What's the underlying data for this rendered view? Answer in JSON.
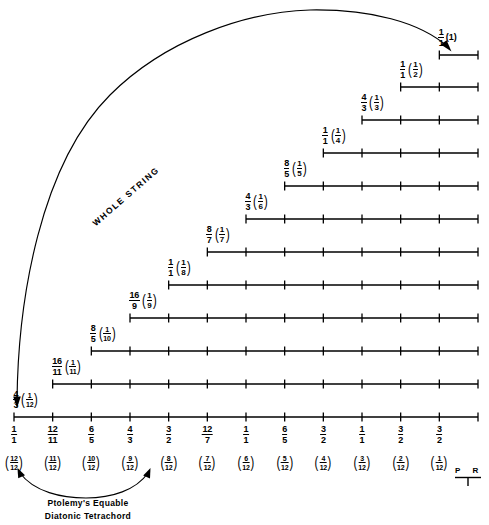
{
  "figure": {
    "annotation_whole_string": "WHOLE  STRING",
    "caption_line1": "Ptolemy's Equable",
    "caption_line2": "Diatonic Tetrachord",
    "pr_mark": "P R",
    "stroke_color": "#000000",
    "background": "#ffffff"
  },
  "chart_data": {
    "type": "line",
    "xlabel": "",
    "ylabel": "",
    "grid": false,
    "legend": "none",
    "x_tick_count": 13,
    "x_axis_left_px": 14,
    "x_axis_right_px": 478,
    "rows": [
      {
        "index": 1,
        "ratio_num": "1",
        "ratio_den": "1",
        "paren_num": "1",
        "paren_den": "",
        "paren_plain": "(1)",
        "start_tick": 11,
        "ticks": 2,
        "y": 55
      },
      {
        "index": 2,
        "ratio_num": "1",
        "ratio_den": "1",
        "paren_num": "1",
        "paren_den": "2",
        "paren_plain": "",
        "start_tick": 10,
        "ticks": 3,
        "y": 87
      },
      {
        "index": 3,
        "ratio_num": "4",
        "ratio_den": "3",
        "paren_num": "1",
        "paren_den": "3",
        "paren_plain": "",
        "start_tick": 9,
        "ticks": 4,
        "y": 120
      },
      {
        "index": 4,
        "ratio_num": "1",
        "ratio_den": "1",
        "paren_num": "1",
        "paren_den": "4",
        "paren_plain": "",
        "start_tick": 8,
        "ticks": 5,
        "y": 153
      },
      {
        "index": 5,
        "ratio_num": "8",
        "ratio_den": "5",
        "paren_num": "1",
        "paren_den": "5",
        "paren_plain": "",
        "start_tick": 7,
        "ticks": 6,
        "y": 186
      },
      {
        "index": 6,
        "ratio_num": "4",
        "ratio_den": "3",
        "paren_num": "1",
        "paren_den": "6",
        "paren_plain": "",
        "start_tick": 6,
        "ticks": 7,
        "y": 219
      },
      {
        "index": 7,
        "ratio_num": "8",
        "ratio_den": "7",
        "paren_num": "1",
        "paren_den": "7",
        "paren_plain": "",
        "start_tick": 5,
        "ticks": 8,
        "y": 252
      },
      {
        "index": 8,
        "ratio_num": "1",
        "ratio_den": "1",
        "paren_num": "1",
        "paren_den": "8",
        "paren_plain": "",
        "start_tick": 4,
        "ticks": 9,
        "y": 285
      },
      {
        "index": 9,
        "ratio_num": "16",
        "ratio_den": "9",
        "paren_num": "1",
        "paren_den": "9",
        "paren_plain": "",
        "start_tick": 3,
        "ticks": 10,
        "y": 318
      },
      {
        "index": 10,
        "ratio_num": "8",
        "ratio_den": "5",
        "paren_num": "1",
        "paren_den": "10",
        "paren_plain": "",
        "start_tick": 2,
        "ticks": 11,
        "y": 351
      },
      {
        "index": 11,
        "ratio_num": "16",
        "ratio_den": "11",
        "paren_num": "1",
        "paren_den": "11",
        "paren_plain": "",
        "start_tick": 1,
        "ticks": 12,
        "y": 384
      },
      {
        "index": 12,
        "ratio_num": "4",
        "ratio_den": "3",
        "paren_num": "1",
        "paren_den": "12",
        "paren_plain": "",
        "start_tick": 0,
        "ticks": 13,
        "y": 417
      }
    ],
    "axis_ratios": [
      {
        "num": "1",
        "den": "1"
      },
      {
        "num": "12",
        "den": "11"
      },
      {
        "num": "6",
        "den": "5"
      },
      {
        "num": "4",
        "den": "3"
      },
      {
        "num": "3",
        "den": "2"
      },
      {
        "num": "12",
        "den": "7"
      },
      {
        "num": "1",
        "den": "1"
      },
      {
        "num": "6",
        "den": "5"
      },
      {
        "num": "3",
        "den": "2"
      },
      {
        "num": "1",
        "den": "1"
      },
      {
        "num": "3",
        "den": "2"
      },
      {
        "num": "3",
        "den": "2"
      }
    ],
    "axis_fractions": [
      {
        "num": "12",
        "den": "12"
      },
      {
        "num": "11",
        "den": "12"
      },
      {
        "num": "10",
        "den": "12"
      },
      {
        "num": "9",
        "den": "12"
      },
      {
        "num": "8",
        "den": "12"
      },
      {
        "num": "7",
        "den": "12"
      },
      {
        "num": "6",
        "den": "12"
      },
      {
        "num": "5",
        "den": "12"
      },
      {
        "num": "4",
        "den": "12"
      },
      {
        "num": "3",
        "den": "12"
      },
      {
        "num": "2",
        "den": "12"
      },
      {
        "num": "1",
        "den": "12"
      }
    ]
  }
}
